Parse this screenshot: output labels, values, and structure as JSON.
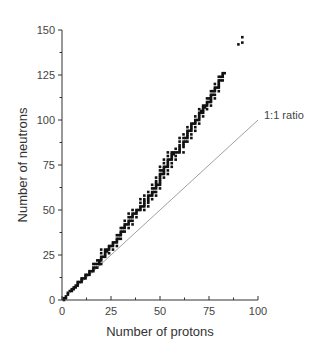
{
  "chart_data": {
    "type": "scatter",
    "title": "",
    "xlabel": "Number of protons",
    "ylabel": "Number of neutrons",
    "xlim": [
      0,
      100
    ],
    "ylim": [
      0,
      150
    ],
    "xticks": [
      0,
      25,
      50,
      75,
      100
    ],
    "yticks": [
      0,
      25,
      50,
      75,
      100,
      125,
      150
    ],
    "grid": false,
    "legend": null,
    "annotations": [
      {
        "text": "1:1 ratio",
        "x": 100,
        "y": 102,
        "target": "reference line N = Z"
      }
    ],
    "series": [
      {
        "name": "Stable nuclei",
        "marker": "square",
        "color": "#111111",
        "points": [
          [
            1,
            0
          ],
          [
            1,
            1
          ],
          [
            2,
            1
          ],
          [
            2,
            2
          ],
          [
            3,
            3
          ],
          [
            3,
            4
          ],
          [
            4,
            5
          ],
          [
            5,
            5
          ],
          [
            5,
            6
          ],
          [
            6,
            6
          ],
          [
            6,
            7
          ],
          [
            7,
            7
          ],
          [
            7,
            8
          ],
          [
            8,
            8
          ],
          [
            8,
            9
          ],
          [
            8,
            10
          ],
          [
            9,
            10
          ],
          [
            10,
            10
          ],
          [
            10,
            11
          ],
          [
            10,
            12
          ],
          [
            11,
            12
          ],
          [
            12,
            12
          ],
          [
            12,
            13
          ],
          [
            12,
            14
          ],
          [
            13,
            14
          ],
          [
            14,
            14
          ],
          [
            14,
            15
          ],
          [
            14,
            16
          ],
          [
            15,
            16
          ],
          [
            16,
            16
          ],
          [
            16,
            17
          ],
          [
            16,
            18
          ],
          [
            16,
            20
          ],
          [
            17,
            18
          ],
          [
            17,
            20
          ],
          [
            18,
            18
          ],
          [
            18,
            20
          ],
          [
            18,
            22
          ],
          [
            19,
            20
          ],
          [
            19,
            21
          ],
          [
            19,
            22
          ],
          [
            20,
            20
          ],
          [
            20,
            22
          ],
          [
            20,
            23
          ],
          [
            20,
            24
          ],
          [
            20,
            26
          ],
          [
            20,
            28
          ],
          [
            21,
            24
          ],
          [
            22,
            24
          ],
          [
            22,
            25
          ],
          [
            22,
            26
          ],
          [
            22,
            27
          ],
          [
            22,
            28
          ],
          [
            23,
            27
          ],
          [
            23,
            28
          ],
          [
            24,
            26
          ],
          [
            24,
            28
          ],
          [
            24,
            29
          ],
          [
            24,
            30
          ],
          [
            25,
            30
          ],
          [
            26,
            28
          ],
          [
            26,
            30
          ],
          [
            26,
            31
          ],
          [
            26,
            32
          ],
          [
            27,
            32
          ],
          [
            28,
            30
          ],
          [
            28,
            32
          ],
          [
            28,
            33
          ],
          [
            28,
            34
          ],
          [
            28,
            36
          ],
          [
            29,
            34
          ],
          [
            29,
            36
          ],
          [
            30,
            34
          ],
          [
            30,
            36
          ],
          [
            30,
            37
          ],
          [
            30,
            38
          ],
          [
            30,
            40
          ],
          [
            31,
            38
          ],
          [
            31,
            40
          ],
          [
            32,
            38
          ],
          [
            32,
            40
          ],
          [
            32,
            41
          ],
          [
            32,
            42
          ],
          [
            32,
            44
          ],
          [
            33,
            42
          ],
          [
            34,
            40
          ],
          [
            34,
            42
          ],
          [
            34,
            43
          ],
          [
            34,
            44
          ],
          [
            34,
            46
          ],
          [
            34,
            48
          ],
          [
            35,
            44
          ],
          [
            35,
            46
          ],
          [
            36,
            42
          ],
          [
            36,
            44
          ],
          [
            36,
            46
          ],
          [
            36,
            47
          ],
          [
            36,
            48
          ],
          [
            36,
            50
          ],
          [
            37,
            48
          ],
          [
            38,
            46
          ],
          [
            38,
            48
          ],
          [
            38,
            49
          ],
          [
            38,
            50
          ],
          [
            39,
            50
          ],
          [
            40,
            50
          ],
          [
            40,
            51
          ],
          [
            40,
            52
          ],
          [
            40,
            54
          ],
          [
            40,
            56
          ],
          [
            41,
            52
          ],
          [
            42,
            50
          ],
          [
            42,
            52
          ],
          [
            42,
            53
          ],
          [
            42,
            54
          ],
          [
            42,
            55
          ],
          [
            42,
            56
          ],
          [
            42,
            58
          ],
          [
            44,
            52
          ],
          [
            44,
            54
          ],
          [
            44,
            55
          ],
          [
            44,
            56
          ],
          [
            44,
            57
          ],
          [
            44,
            58
          ],
          [
            44,
            60
          ],
          [
            45,
            58
          ],
          [
            46,
            56
          ],
          [
            46,
            58
          ],
          [
            46,
            59
          ],
          [
            46,
            60
          ],
          [
            46,
            62
          ],
          [
            46,
            64
          ],
          [
            47,
            60
          ],
          [
            47,
            62
          ],
          [
            48,
            58
          ],
          [
            48,
            60
          ],
          [
            48,
            62
          ],
          [
            48,
            63
          ],
          [
            48,
            64
          ],
          [
            48,
            65
          ],
          [
            48,
            66
          ],
          [
            48,
            68
          ],
          [
            49,
            64
          ],
          [
            50,
            62
          ],
          [
            50,
            64
          ],
          [
            50,
            65
          ],
          [
            50,
            66
          ],
          [
            50,
            67
          ],
          [
            50,
            68
          ],
          [
            50,
            69
          ],
          [
            50,
            70
          ],
          [
            50,
            72
          ],
          [
            50,
            74
          ],
          [
            51,
            70
          ],
          [
            51,
            72
          ],
          [
            52,
            68
          ],
          [
            52,
            70
          ],
          [
            52,
            71
          ],
          [
            52,
            72
          ],
          [
            52,
            73
          ],
          [
            52,
            74
          ],
          [
            52,
            76
          ],
          [
            52,
            78
          ],
          [
            53,
            74
          ],
          [
            54,
            70
          ],
          [
            54,
            72
          ],
          [
            54,
            74
          ],
          [
            54,
            75
          ],
          [
            54,
            76
          ],
          [
            54,
            77
          ],
          [
            54,
            78
          ],
          [
            54,
            80
          ],
          [
            54,
            82
          ],
          [
            55,
            78
          ],
          [
            56,
            74
          ],
          [
            56,
            76
          ],
          [
            56,
            78
          ],
          [
            56,
            79
          ],
          [
            56,
            80
          ],
          [
            56,
            81
          ],
          [
            56,
            82
          ],
          [
            57,
            81
          ],
          [
            57,
            82
          ],
          [
            58,
            78
          ],
          [
            58,
            80
          ],
          [
            58,
            82
          ],
          [
            58,
            84
          ],
          [
            59,
            82
          ],
          [
            60,
            82
          ],
          [
            60,
            83
          ],
          [
            60,
            84
          ],
          [
            60,
            85
          ],
          [
            60,
            86
          ],
          [
            60,
            88
          ],
          [
            60,
            90
          ],
          [
            62,
            82
          ],
          [
            62,
            85
          ],
          [
            62,
            86
          ],
          [
            62,
            87
          ],
          [
            62,
            88
          ],
          [
            62,
            90
          ],
          [
            62,
            92
          ],
          [
            63,
            88
          ],
          [
            63,
            90
          ],
          [
            64,
            88
          ],
          [
            64,
            90
          ],
          [
            64,
            91
          ],
          [
            64,
            92
          ],
          [
            64,
            93
          ],
          [
            64,
            94
          ],
          [
            64,
            96
          ],
          [
            65,
            94
          ],
          [
            66,
            90
          ],
          [
            66,
            92
          ],
          [
            66,
            94
          ],
          [
            66,
            95
          ],
          [
            66,
            96
          ],
          [
            66,
            97
          ],
          [
            66,
            98
          ],
          [
            67,
            98
          ],
          [
            68,
            94
          ],
          [
            68,
            96
          ],
          [
            68,
            98
          ],
          [
            68,
            99
          ],
          [
            68,
            100
          ],
          [
            68,
            102
          ],
          [
            69,
            100
          ],
          [
            70,
            98
          ],
          [
            70,
            100
          ],
          [
            70,
            101
          ],
          [
            70,
            102
          ],
          [
            70,
            103
          ],
          [
            70,
            104
          ],
          [
            70,
            106
          ],
          [
            71,
            104
          ],
          [
            71,
            105
          ],
          [
            72,
            102
          ],
          [
            72,
            104
          ],
          [
            72,
            105
          ],
          [
            72,
            106
          ],
          [
            72,
            107
          ],
          [
            72,
            108
          ],
          [
            73,
            107
          ],
          [
            73,
            108
          ],
          [
            74,
            106
          ],
          [
            74,
            108
          ],
          [
            74,
            109
          ],
          [
            74,
            110
          ],
          [
            74,
            112
          ],
          [
            75,
            110
          ],
          [
            75,
            112
          ],
          [
            76,
            108
          ],
          [
            76,
            110
          ],
          [
            76,
            111
          ],
          [
            76,
            112
          ],
          [
            76,
            113
          ],
          [
            76,
            114
          ],
          [
            76,
            116
          ],
          [
            77,
            114
          ],
          [
            77,
            116
          ],
          [
            78,
            112
          ],
          [
            78,
            114
          ],
          [
            78,
            116
          ],
          [
            78,
            117
          ],
          [
            78,
            118
          ],
          [
            78,
            120
          ],
          [
            79,
            118
          ],
          [
            80,
            116
          ],
          [
            80,
            118
          ],
          [
            80,
            119
          ],
          [
            80,
            120
          ],
          [
            80,
            121
          ],
          [
            80,
            122
          ],
          [
            80,
            124
          ],
          [
            81,
            122
          ],
          [
            81,
            124
          ],
          [
            82,
            122
          ],
          [
            82,
            124
          ],
          [
            82,
            125
          ],
          [
            82,
            126
          ],
          [
            83,
            126
          ],
          [
            90,
            142
          ],
          [
            92,
            143
          ],
          [
            92,
            146
          ]
        ]
      },
      {
        "name": "1:1 ratio",
        "type": "line",
        "color": "#888888",
        "points": [
          [
            0,
            0
          ],
          [
            100,
            100
          ]
        ]
      }
    ]
  }
}
